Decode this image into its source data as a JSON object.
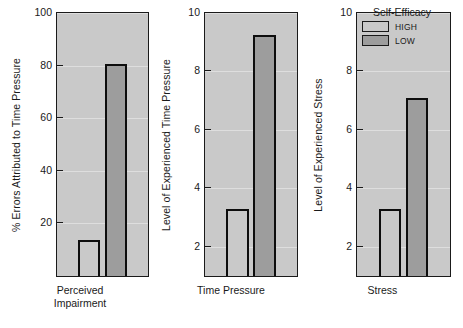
{
  "chart_data": {
    "type": "bar",
    "title": "",
    "subtitle": "",
    "grid": true,
    "legend": {
      "title": "Self-Efficacy",
      "position": "top-left of third panel",
      "entries": [
        {
          "name": "HIGH",
          "color": "#c9c9c9"
        },
        {
          "name": "LOW",
          "color": "#9d9d9d"
        }
      ]
    },
    "series": [
      {
        "name": "HIGH",
        "values": [
          13.5,
          3.3,
          3.3
        ]
      },
      {
        "name": "LOW",
        "values": [
          80.5,
          9.25,
          7.1
        ]
      }
    ],
    "panels": [
      {
        "id": "perceived-impairment",
        "xlabel_lines": [
          "Perceived",
          "Impairment"
        ],
        "ylabel": "% Errors Attributed to Time Pressure",
        "ylim": [
          0,
          100
        ],
        "yticks": [
          20,
          40,
          60,
          80,
          100
        ],
        "ytick_labels": [
          "20",
          "40",
          "60",
          "80",
          "100"
        ],
        "bars": [
          {
            "series": "HIGH",
            "value": 13.5,
            "color": "#c9c9c9"
          },
          {
            "series": "LOW",
            "value": 80.5,
            "color": "#9d9d9d"
          }
        ]
      },
      {
        "id": "time-pressure",
        "xlabel_lines": [
          "Time Pressure"
        ],
        "ylabel": "Level of Experienced Time Pressure",
        "ylim": [
          1,
          10
        ],
        "yticks": [
          2,
          4,
          6,
          8,
          10
        ],
        "ytick_labels": [
          "2",
          "4",
          "6",
          "8",
          "10"
        ],
        "bars": [
          {
            "series": "HIGH",
            "value": 3.3,
            "color": "#c9c9c9"
          },
          {
            "series": "LOW",
            "value": 9.25,
            "color": "#9d9d9d"
          }
        ]
      },
      {
        "id": "stress",
        "xlabel_lines": [
          "Stress"
        ],
        "ylabel": "Level of Experienced Stress",
        "ylim": [
          1,
          10
        ],
        "yticks": [
          2,
          4,
          6,
          8,
          10
        ],
        "ytick_labels": [
          "2",
          "4",
          "6",
          "8",
          "10"
        ],
        "bars": [
          {
            "series": "HIGH",
            "value": 3.3,
            "color": "#c9c9c9"
          },
          {
            "series": "LOW",
            "value": 7.1,
            "color": "#9d9d9d"
          }
        ]
      }
    ]
  }
}
